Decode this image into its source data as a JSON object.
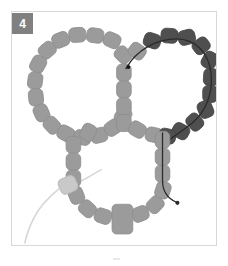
{
  "figure": {
    "step_label": "4",
    "badge_color": "#808080",
    "frame_border_color": "#d8d8d8",
    "background_color": "#ffffff"
  },
  "palette": {
    "bead_light": "#9b9b9b",
    "bead_light_stroke": "#8e8e8e",
    "bead_dark": "#4f4f4f",
    "bead_dark_stroke": "#454545",
    "bead_pale": "#c9c9c9",
    "bead_pale_stroke": "#bdbdbd",
    "thread_dark": "#2b2b2b",
    "thread_light": "#d6d6d6"
  },
  "legend": {
    "light_bead_name": "light-gray-bead",
    "dark_bead_name": "dark-gray-bead",
    "pale_bead_name": "pale-tail-bead",
    "focal_bead_name": "focal-tube-bead"
  },
  "counts": {
    "left_ring_beads": 17,
    "right_ring_beads": 17,
    "bottom_ring_beads": 17,
    "center_column_beads": 4,
    "dark_beads": 12,
    "total_visible_beads": 48
  },
  "annotations": {
    "knot_label": "knot-dot",
    "needle_label": "needle-end-dot",
    "working_thread_label": "working-thread",
    "tail_thread_label": "tail-thread"
  }
}
